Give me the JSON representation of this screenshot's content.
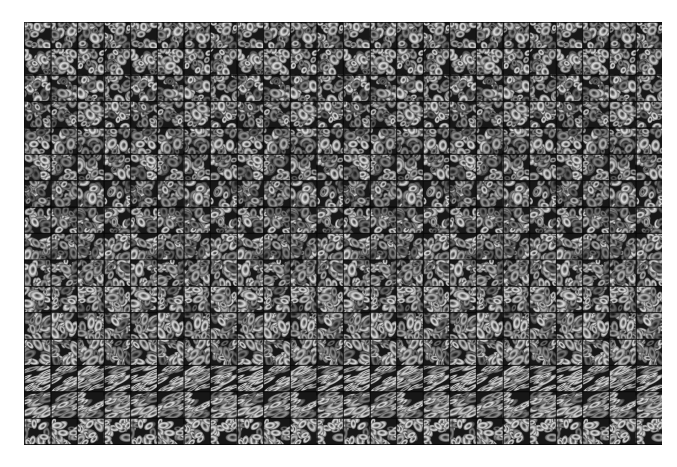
{
  "page": {
    "background_color": "#ffffff",
    "width": 677,
    "height": 467,
    "content_type": "image-montage"
  },
  "montage": {
    "name": "microscopy-tile-montage",
    "description": "Grid montage of grayscale fluorescence microscopy cell-nucleus image patches",
    "x": 24,
    "y": 22,
    "width": 638,
    "height": 423,
    "background_color": "#000000",
    "tile_columns": 24,
    "tile_rows": 16,
    "tile_width": 26.6,
    "tile_height": 26.4,
    "seam_color": "#0c0c0c",
    "modality": "fluorescence-microscopy",
    "colormap": "grayscale",
    "intensity_min": 0,
    "intensity_max": 255,
    "horizontal_repeat_period_tiles": 4,
    "vertical_repeat_period_tiles": 4
  },
  "chart_data": {
    "type": "heatmap",
    "title": "",
    "xlabel": "",
    "ylabel": "",
    "grid": true,
    "legend_position": "none",
    "colormap": "gray",
    "rows": 16,
    "cols": 24,
    "row_styles": [
      {
        "row": 0,
        "morphology": "round-bright",
        "density": 0.72,
        "elongation": 0.15,
        "mean_intensity": 62,
        "brightness": 1.05
      },
      {
        "row": 1,
        "morphology": "round-bright",
        "density": 0.74,
        "elongation": 0.14,
        "mean_intensity": 60,
        "brightness": 1.02
      },
      {
        "row": 2,
        "morphology": "round",
        "density": 0.76,
        "elongation": 0.16,
        "mean_intensity": 56,
        "brightness": 0.98
      },
      {
        "row": 3,
        "morphology": "round",
        "density": 0.78,
        "elongation": 0.18,
        "mean_intensity": 54,
        "brightness": 0.96
      },
      {
        "row": 4,
        "morphology": "round-dense",
        "density": 0.8,
        "elongation": 0.17,
        "mean_intensity": 52,
        "brightness": 0.94
      },
      {
        "row": 5,
        "morphology": "round-dense",
        "density": 0.82,
        "elongation": 0.19,
        "mean_intensity": 50,
        "brightness": 0.92
      },
      {
        "row": 6,
        "morphology": "round-dense",
        "density": 0.83,
        "elongation": 0.2,
        "mean_intensity": 51,
        "brightness": 0.93
      },
      {
        "row": 7,
        "morphology": "round-dense",
        "density": 0.84,
        "elongation": 0.22,
        "mean_intensity": 53,
        "brightness": 0.95
      },
      {
        "row": 8,
        "morphology": "round-clustered",
        "density": 0.86,
        "elongation": 0.24,
        "mean_intensity": 55,
        "brightness": 0.97
      },
      {
        "row": 9,
        "morphology": "round-clustered",
        "density": 0.86,
        "elongation": 0.26,
        "mean_intensity": 57,
        "brightness": 0.99
      },
      {
        "row": 10,
        "morphology": "round-clustered",
        "density": 0.85,
        "elongation": 0.28,
        "mean_intensity": 58,
        "brightness": 1.0
      },
      {
        "row": 11,
        "morphology": "mixed",
        "density": 0.84,
        "elongation": 0.32,
        "mean_intensity": 59,
        "brightness": 1.01
      },
      {
        "row": 12,
        "morphology": "mixed",
        "density": 0.83,
        "elongation": 0.38,
        "mean_intensity": 60,
        "brightness": 1.03
      },
      {
        "row": 13,
        "morphology": "elongated-streaked",
        "density": 0.78,
        "elongation": 0.88,
        "mean_intensity": 66,
        "brightness": 1.12
      },
      {
        "row": 14,
        "morphology": "elongated-bright",
        "density": 0.8,
        "elongation": 0.62,
        "mean_intensity": 70,
        "brightness": 1.16
      },
      {
        "row": 15,
        "morphology": "round-bright-large",
        "density": 0.74,
        "elongation": 0.3,
        "mean_intensity": 74,
        "brightness": 1.2
      }
    ]
  }
}
